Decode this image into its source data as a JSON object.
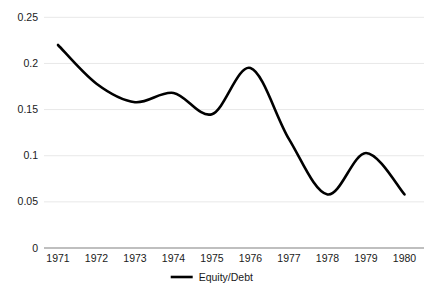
{
  "chart_data": {
    "type": "line",
    "title": "",
    "subtitle": "",
    "xlabel": "",
    "ylabel": "",
    "categories": [
      "1971",
      "1972",
      "1973",
      "1974",
      "1975",
      "1976",
      "1977",
      "1978",
      "1979",
      "1980"
    ],
    "x": [
      1971,
      1972,
      1973,
      1974,
      1975,
      1976,
      1977,
      1978,
      1979,
      1980
    ],
    "series": [
      {
        "name": "Equity/Debt",
        "values": [
          0.22,
          0.178,
          0.158,
          0.168,
          0.145,
          0.195,
          0.118,
          0.058,
          0.103,
          0.058
        ],
        "color": "#000000",
        "smooth": true,
        "line_width": 2.6
      }
    ],
    "ylim": [
      0,
      0.25
    ],
    "yticks": [
      0,
      0.05,
      0.1,
      0.15,
      0.2,
      0.25
    ],
    "ytick_labels": [
      "0",
      "0.05",
      "0.1",
      "0.15",
      "0.2",
      "0.25"
    ],
    "xtick_labels": [
      "1971",
      "1972",
      "1973",
      "1974",
      "1975",
      "1976",
      "1977",
      "1978",
      "1979",
      "1980"
    ],
    "grid": true,
    "grid_color": "#e8e8e8",
    "axis_color": "#808080",
    "legend": {
      "position": "bottom",
      "entries": [
        {
          "label": "Equity/Debt",
          "color": "#000000",
          "marker": "line"
        }
      ]
    },
    "background": "#ffffff"
  },
  "axis": {
    "y_labels": [
      "0.25",
      "0.2",
      "0.15",
      "0.1",
      "0.05",
      "0"
    ],
    "x_labels": [
      "1971",
      "1972",
      "1973",
      "1974",
      "1975",
      "1976",
      "1977",
      "1978",
      "1979",
      "1980"
    ]
  },
  "legend": {
    "series_label": "Equity/Debt"
  }
}
